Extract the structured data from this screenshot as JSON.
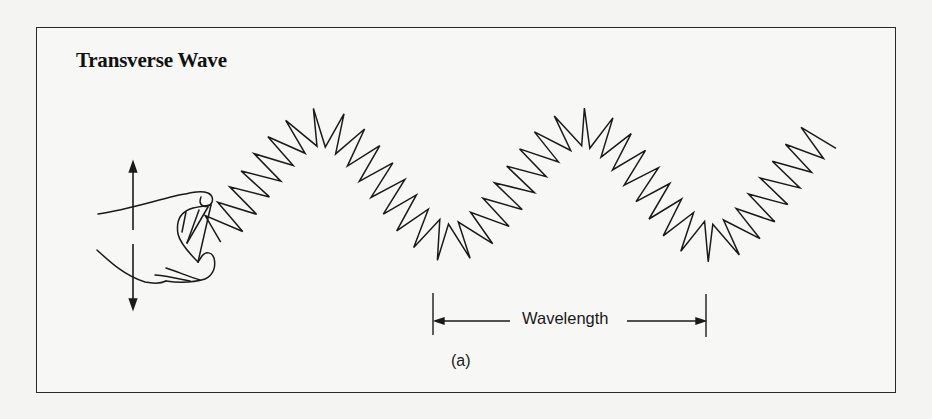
{
  "figure": {
    "title": "Transverse Wave",
    "panel_label": "(a)",
    "wavelength_label": "Wavelength",
    "colors": {
      "ink": "#1a1a1a",
      "paper": "#f7f7f5",
      "frame": "#2a2a2a"
    },
    "elements": {
      "hand": "hand-holding-spring",
      "motion_arrow": "vertical-double-arrow (up/down)",
      "wave": "zigzag spring forming sinusoidal transverse wave",
      "wavelength_marker": "horizontal double arrow spanning one wavelength between trough-aligned tick marks"
    }
  }
}
